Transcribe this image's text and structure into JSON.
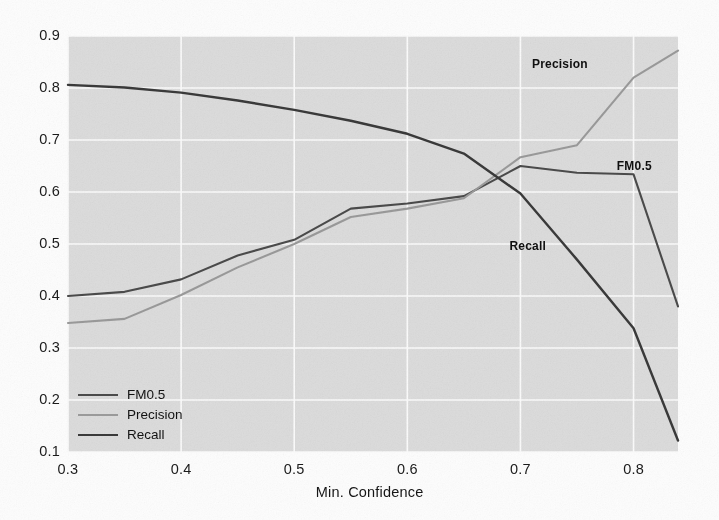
{
  "chart_data": {
    "type": "line",
    "title": "",
    "xlabel": "Min. Confidence",
    "ylabel": "",
    "xlim": [
      0.3,
      0.8393
    ],
    "ylim": [
      0.1,
      0.9
    ],
    "grid": true,
    "legend_position": "lower-left-inside",
    "xticks": [
      "0.3",
      "0.4",
      "0.5",
      "0.6",
      "0.7",
      "0.8"
    ],
    "xtick_values": [
      0.3,
      0.4,
      0.5,
      0.6,
      0.7,
      0.8
    ],
    "yticks": [
      "0.1",
      "0.2",
      "0.3",
      "0.4",
      "0.5",
      "0.6",
      "0.7",
      "0.8",
      "0.9"
    ],
    "ytick_values": [
      0.1,
      0.2,
      0.3,
      0.4,
      0.5,
      0.6,
      0.7,
      0.8,
      0.9
    ],
    "x": [
      0.3,
      0.35,
      0.4,
      0.45,
      0.5,
      0.55,
      0.6,
      0.65,
      0.7,
      0.75,
      0.8,
      0.8393
    ],
    "series": [
      {
        "name": "FM0.5",
        "color": "#4b4b4b",
        "width": 2.1,
        "values": [
          0.4,
          0.408,
          0.432,
          0.478,
          0.508,
          0.568,
          0.578,
          0.592,
          0.65,
          0.637,
          0.634,
          0.38
        ]
      },
      {
        "name": "Precision",
        "color": "#9a9a9a",
        "width": 2.1,
        "values": [
          0.348,
          0.356,
          0.402,
          0.455,
          0.5,
          0.552,
          0.568,
          0.588,
          0.667,
          0.69,
          0.82,
          0.872
        ]
      },
      {
        "name": "Recall",
        "color": "#3a3a3a",
        "width": 2.4,
        "values": [
          0.806,
          0.801,
          0.791,
          0.776,
          0.758,
          0.737,
          0.712,
          0.674,
          0.597,
          0.47,
          0.338,
          0.122
        ]
      }
    ],
    "annotations": [
      {
        "text": "Precision",
        "x": 0.735,
        "y": 0.845
      },
      {
        "text": "FM0.5",
        "x": 0.81,
        "y": 0.648
      },
      {
        "text": "Recall",
        "x": 0.715,
        "y": 0.495
      }
    ],
    "legend": [
      {
        "label": "FM0.5",
        "color": "#4b4b4b",
        "width": 2.1
      },
      {
        "label": "Precision",
        "color": "#9a9a9a",
        "width": 2.1
      },
      {
        "label": "Recall",
        "color": "#3a3a3a",
        "width": 2.4
      }
    ],
    "style": {
      "plot_background": "#dcdcdc",
      "gridline_color": "#fbfbfb",
      "figure_background": "#fdfdfd"
    }
  }
}
